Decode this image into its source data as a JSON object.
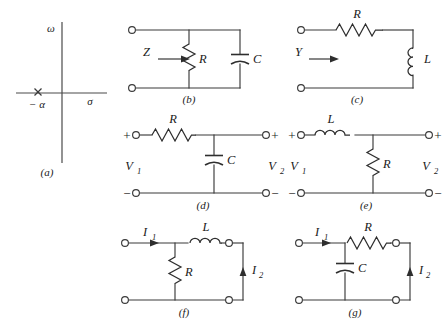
{
  "figure": {
    "background_color": "#ffffff",
    "line_color": "#3a3a3a"
  },
  "panels": {
    "a": {
      "caption": "(a)",
      "type": "pole-zero-plot",
      "axis_vertical_label": "ω",
      "axis_horizontal_label": "σ",
      "pole_label": "− α",
      "pole_marker": "x"
    },
    "b": {
      "caption": "(b)",
      "type": "one-port-impedance",
      "port_label": "Z",
      "components": [
        {
          "name": "resistor",
          "label": "R",
          "orientation": "vertical",
          "position": "shunt"
        },
        {
          "name": "capacitor",
          "label": "C",
          "orientation": "vertical",
          "position": "shunt"
        }
      ]
    },
    "c": {
      "caption": "(c)",
      "type": "one-port-admittance",
      "port_label": "Y",
      "components": [
        {
          "name": "resistor",
          "label": "R",
          "orientation": "horizontal",
          "position": "series"
        },
        {
          "name": "inductor",
          "label": "L",
          "orientation": "vertical",
          "position": "series"
        }
      ]
    },
    "d": {
      "caption": "(d)",
      "type": "two-port-voltage",
      "input_label": "V",
      "input_sub": "1",
      "output_label": "V",
      "output_sub": "2",
      "polarity_top_left": "+",
      "polarity_bottom_left": "−",
      "polarity_top_right": "+",
      "polarity_bottom_right": "−",
      "components": [
        {
          "name": "resistor",
          "label": "R",
          "orientation": "horizontal",
          "position": "series"
        },
        {
          "name": "capacitor",
          "label": "C",
          "orientation": "vertical",
          "position": "shunt"
        }
      ]
    },
    "e": {
      "caption": "(e)",
      "type": "two-port-voltage",
      "input_label": "V",
      "input_sub": "1",
      "output_label": "V",
      "output_sub": "2",
      "polarity_top_left": "+",
      "polarity_bottom_left": "−",
      "polarity_top_right": "+",
      "polarity_bottom_right": "−",
      "components": [
        {
          "name": "inductor",
          "label": "L",
          "orientation": "horizontal",
          "position": "series"
        },
        {
          "name": "resistor",
          "label": "R",
          "orientation": "vertical",
          "position": "shunt"
        }
      ]
    },
    "f": {
      "caption": "(f)",
      "type": "two-port-current",
      "input_label": "I",
      "input_sub": "1",
      "output_label": "I",
      "output_sub": "2",
      "components": [
        {
          "name": "resistor",
          "label": "R",
          "orientation": "vertical",
          "position": "shunt"
        },
        {
          "name": "inductor",
          "label": "L",
          "orientation": "horizontal",
          "position": "series"
        }
      ]
    },
    "g": {
      "caption": "(g)",
      "type": "two-port-current",
      "input_label": "I",
      "input_sub": "1",
      "output_label": "I",
      "output_sub": "2",
      "components": [
        {
          "name": "capacitor",
          "label": "C",
          "orientation": "vertical",
          "position": "shunt"
        },
        {
          "name": "resistor",
          "label": "R",
          "orientation": "horizontal",
          "position": "series"
        }
      ]
    }
  }
}
